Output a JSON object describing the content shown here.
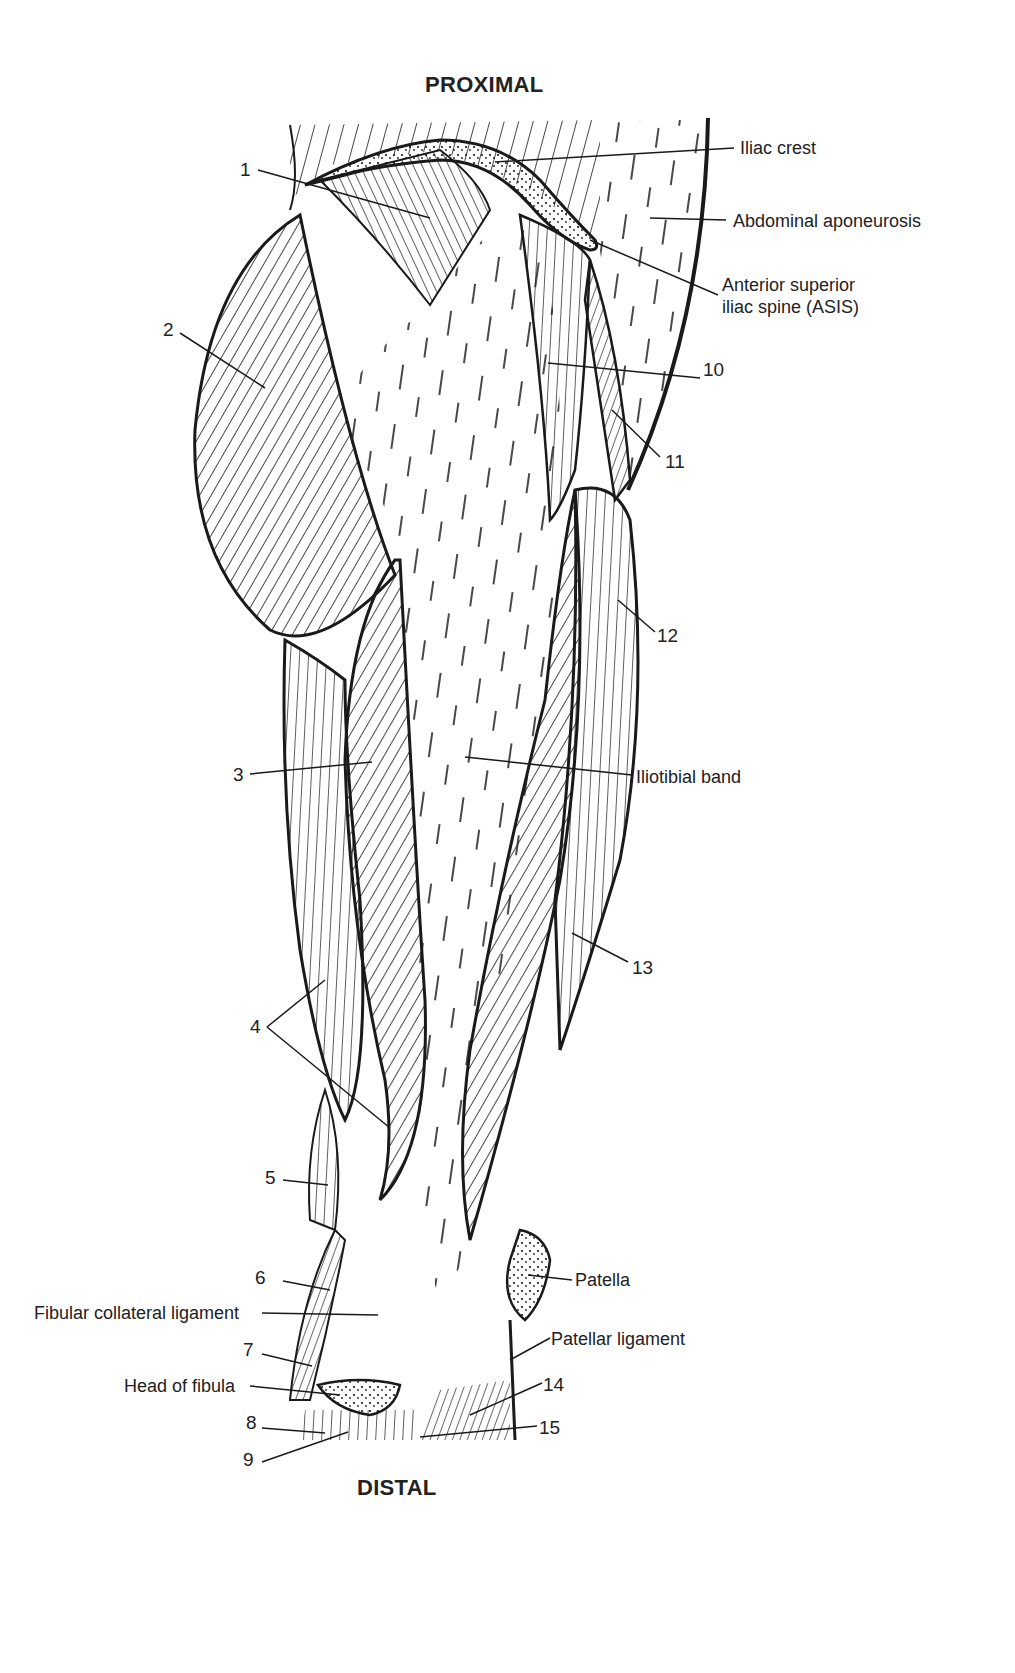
{
  "diagram": {
    "title_top": "PROXIMAL",
    "title_bottom": "DISTAL",
    "named_labels": [
      {
        "id": "iliac-crest",
        "text": "Iliac crest"
      },
      {
        "id": "abdominal-aponeurosis",
        "text": "Abdominal aponeurosis"
      },
      {
        "id": "asis-line1",
        "text": "Anterior superior"
      },
      {
        "id": "asis-line2",
        "text": "iliac spine (ASIS)"
      },
      {
        "id": "iliotibial-band",
        "text": "Iliotibial band"
      },
      {
        "id": "patella",
        "text": "Patella"
      },
      {
        "id": "patellar-ligament",
        "text": "Patellar ligament"
      },
      {
        "id": "fibular-collateral-ligament",
        "text": "Fibular collateral ligament"
      },
      {
        "id": "head-of-fibula",
        "text": "Head of fibula"
      }
    ],
    "numbered_labels": [
      "1",
      "2",
      "3",
      "4",
      "5",
      "6",
      "7",
      "8",
      "9",
      "10",
      "11",
      "12",
      "13",
      "14",
      "15"
    ],
    "colors": {
      "ink": "#1a1a1a",
      "paper": "#ffffff"
    }
  }
}
